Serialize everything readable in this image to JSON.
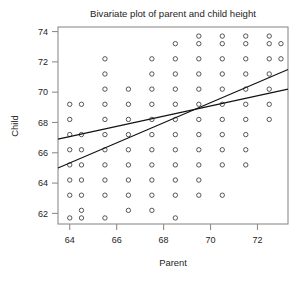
{
  "chart_data": {
    "type": "scatter",
    "title": "Bivariate plot of parent and child height",
    "xlabel": "Parent",
    "ylabel": "Child",
    "xlim": [
      63.5,
      73.3
    ],
    "ylim": [
      61.3,
      74.3
    ],
    "xticks": [
      64,
      66,
      68,
      70,
      72
    ],
    "xticklabels": [
      "64",
      "66",
      "68",
      "70",
      "72"
    ],
    "yticks": [
      62,
      64,
      66,
      68,
      70,
      72,
      74
    ],
    "yticklabels": [
      "62",
      "64",
      "66",
      "68",
      "70",
      "72",
      "74"
    ],
    "grid": false,
    "legend": null,
    "marker": "open-circle",
    "points": [
      [
        64.0,
        69.2
      ],
      [
        64.0,
        68.2
      ],
      [
        64.0,
        67.2
      ],
      [
        64.0,
        66.2
      ],
      [
        64.0,
        65.2
      ],
      [
        64.0,
        64.2
      ],
      [
        64.0,
        63.2
      ],
      [
        64.0,
        61.7
      ],
      [
        64.5,
        69.2
      ],
      [
        64.5,
        67.2
      ],
      [
        64.5,
        66.2
      ],
      [
        64.5,
        65.2
      ],
      [
        64.5,
        64.2
      ],
      [
        64.5,
        63.2
      ],
      [
        64.5,
        62.2
      ],
      [
        64.5,
        61.7
      ],
      [
        65.5,
        72.2
      ],
      [
        65.5,
        71.2
      ],
      [
        65.5,
        70.2
      ],
      [
        65.5,
        69.2
      ],
      [
        65.5,
        68.2
      ],
      [
        65.5,
        67.2
      ],
      [
        65.5,
        66.2
      ],
      [
        65.5,
        65.2
      ],
      [
        65.5,
        64.2
      ],
      [
        65.5,
        63.2
      ],
      [
        65.5,
        61.7
      ],
      [
        66.5,
        70.2
      ],
      [
        66.5,
        69.2
      ],
      [
        66.5,
        68.2
      ],
      [
        66.5,
        67.2
      ],
      [
        66.5,
        66.2
      ],
      [
        66.5,
        65.2
      ],
      [
        66.5,
        64.2
      ],
      [
        66.5,
        63.2
      ],
      [
        66.5,
        62.2
      ],
      [
        67.5,
        72.2
      ],
      [
        67.5,
        71.2
      ],
      [
        67.5,
        70.2
      ],
      [
        67.5,
        69.2
      ],
      [
        67.5,
        68.2
      ],
      [
        67.5,
        67.2
      ],
      [
        67.5,
        66.2
      ],
      [
        67.5,
        65.2
      ],
      [
        67.5,
        64.2
      ],
      [
        67.5,
        63.2
      ],
      [
        67.5,
        62.2
      ],
      [
        68.5,
        73.2
      ],
      [
        68.5,
        72.2
      ],
      [
        68.5,
        71.2
      ],
      [
        68.5,
        70.2
      ],
      [
        68.5,
        69.2
      ],
      [
        68.5,
        68.2
      ],
      [
        68.5,
        67.2
      ],
      [
        68.5,
        66.2
      ],
      [
        68.5,
        65.2
      ],
      [
        68.5,
        64.2
      ],
      [
        68.5,
        63.2
      ],
      [
        68.5,
        61.7
      ],
      [
        69.5,
        73.7
      ],
      [
        69.5,
        73.2
      ],
      [
        69.5,
        72.2
      ],
      [
        69.5,
        71.2
      ],
      [
        69.5,
        70.2
      ],
      [
        69.5,
        69.2
      ],
      [
        69.5,
        68.2
      ],
      [
        69.5,
        67.2
      ],
      [
        69.5,
        66.2
      ],
      [
        69.5,
        65.2
      ],
      [
        69.5,
        64.2
      ],
      [
        69.5,
        63.2
      ],
      [
        70.5,
        73.7
      ],
      [
        70.5,
        73.2
      ],
      [
        70.5,
        72.2
      ],
      [
        70.5,
        71.2
      ],
      [
        70.5,
        70.2
      ],
      [
        70.5,
        69.2
      ],
      [
        70.5,
        68.2
      ],
      [
        70.5,
        67.2
      ],
      [
        70.5,
        66.2
      ],
      [
        70.5,
        65.2
      ],
      [
        70.5,
        63.2
      ],
      [
        71.5,
        73.7
      ],
      [
        71.5,
        73.2
      ],
      [
        71.5,
        72.2
      ],
      [
        71.5,
        71.2
      ],
      [
        71.5,
        70.2
      ],
      [
        71.5,
        69.2
      ],
      [
        71.5,
        68.2
      ],
      [
        71.5,
        67.2
      ],
      [
        71.5,
        66.2
      ],
      [
        71.5,
        65.2
      ],
      [
        72.5,
        73.7
      ],
      [
        72.5,
        73.2
      ],
      [
        72.5,
        72.2
      ],
      [
        72.5,
        71.2
      ],
      [
        72.5,
        70.2
      ],
      [
        72.5,
        69.2
      ],
      [
        72.5,
        68.2
      ],
      [
        73.0,
        73.2
      ],
      [
        73.0,
        72.2
      ]
    ],
    "lines": [
      {
        "name": "sd-line",
        "x": [
          63.5,
          73.3
        ],
        "y": [
          65.0,
          71.5
        ]
      },
      {
        "name": "regression-line",
        "x": [
          63.5,
          73.3
        ],
        "y": [
          66.9,
          70.2
        ]
      }
    ]
  }
}
